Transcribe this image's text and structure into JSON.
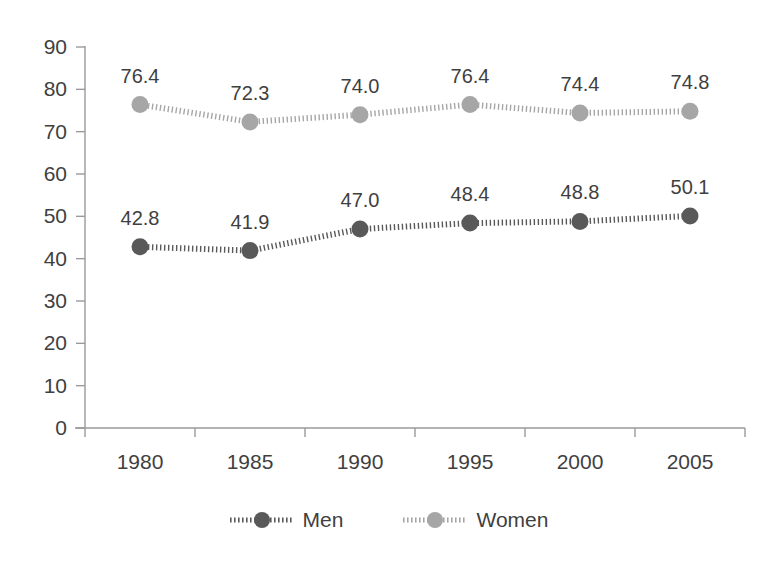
{
  "chart_data": {
    "type": "line",
    "title": "",
    "subtitle": "",
    "xlabel": "",
    "ylabel": "",
    "categories": [
      "1980",
      "1985",
      "1990",
      "1995",
      "2000",
      "2005"
    ],
    "series": [
      {
        "name": "Men",
        "color": "#595959",
        "marker": "circle",
        "linestyle": "dotted",
        "values": [
          42.8,
          41.9,
          47.0,
          48.4,
          48.8,
          50.1
        ],
        "labels": [
          "42.8",
          "41.9",
          "47.0",
          "48.4",
          "48.8",
          "50.1"
        ]
      },
      {
        "name": "Women",
        "color": "#a6a6a6",
        "marker": "circle",
        "linestyle": "dotted",
        "values": [
          76.4,
          72.3,
          74.0,
          76.4,
          74.4,
          74.8
        ],
        "labels": [
          "76.4",
          "72.3",
          "74.0",
          "76.4",
          "74.4",
          "74.8"
        ]
      }
    ],
    "ylim": [
      0,
      90
    ],
    "ytick_values": [
      0,
      10,
      20,
      30,
      40,
      50,
      60,
      70,
      80,
      90
    ],
    "ytick_labels": [
      "0",
      "10",
      "20",
      "30",
      "40",
      "50",
      "60",
      "70",
      "80",
      "90"
    ],
    "xtick_labels": [
      "1980",
      "1985",
      "1990",
      "1995",
      "2000",
      "2005"
    ],
    "grid": false,
    "legend_position": "bottom",
    "data_labels_shown": true,
    "axis_color": "#9a9a9a",
    "text_color": "#3f3f3f",
    "background": "#ffffff"
  },
  "legend": {
    "entries": [
      {
        "label": "Men",
        "color": "#595959"
      },
      {
        "label": "Women",
        "color": "#a6a6a6"
      }
    ]
  }
}
